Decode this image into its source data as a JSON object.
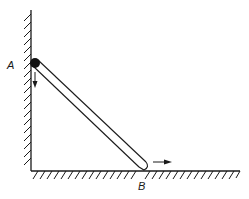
{
  "diagram": {
    "labels": {
      "point_a": "A",
      "point_b": "B"
    },
    "colors": {
      "ink": "#1a1a1a",
      "background": "#ffffff"
    },
    "elements": {
      "wall": "vertical hatched wall",
      "floor": "horizontal hatched floor",
      "rod": "rigid rod from A to B",
      "ball": "filled dot at end A",
      "arrow_a": "velocity arrow at A pointing down",
      "arrow_b": "velocity arrow at B pointing right"
    }
  }
}
